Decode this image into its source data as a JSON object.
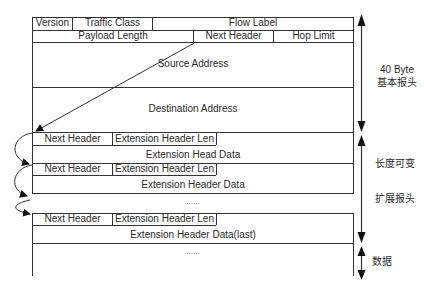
{
  "diagram": {
    "type": "IPv6 packet header structure",
    "base_header": {
      "row1": [
        "Version",
        "Traffic Class",
        "Flow Label"
      ],
      "row2": [
        "Payload Length",
        "Next Header",
        "Hop Limit"
      ],
      "source": "Source Address",
      "destination": "Destination Address"
    },
    "extension_headers": [
      {
        "next_header": "Next Header",
        "len": "Extension Header Len",
        "data": "Extension Head Data"
      },
      {
        "next_header": "Next Header",
        "len": "Extension Header Len",
        "data": "Extension Header Data"
      },
      {
        "next_header": "Next Header",
        "len": "Extension Header Len",
        "data": "Extension Header Data(last)"
      }
    ],
    "ellipsis_between": "......",
    "ellipsis_payload": "......",
    "side_labels": {
      "base_size": "40 Byte",
      "base_desc": "基本报头",
      "variable": "长度可变",
      "ext_desc": "扩展报头",
      "data": "数据"
    },
    "colors": {
      "line": "#333333",
      "text": "#2a2a2a",
      "background": "#ffffff"
    }
  }
}
